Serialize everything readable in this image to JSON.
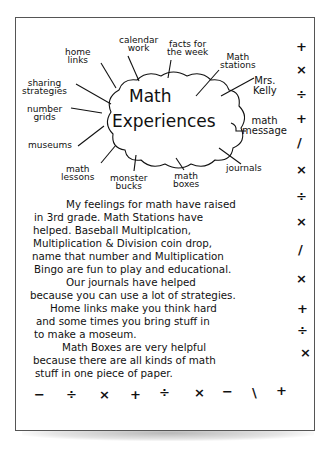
{
  "document": {
    "title_line1": "Math",
    "title_line2": "Experiences",
    "web_labels": [
      {
        "id": "home-links",
        "text": "home\nlinks",
        "line1": "home",
        "line2": "links"
      },
      {
        "id": "calendar-work",
        "line1": "calendar",
        "line2": "work"
      },
      {
        "id": "facts-for-the-week",
        "line1": "facts for",
        "line2": "the week"
      },
      {
        "id": "math-stations",
        "line1": "Math",
        "line2": "stations"
      },
      {
        "id": "mrs-kelly",
        "line1": "Mrs.",
        "line2": "Kelly"
      },
      {
        "id": "math-message",
        "line1": "math",
        "line2": "message"
      },
      {
        "id": "journals",
        "line1": "journals"
      },
      {
        "id": "math-boxes",
        "line1": "math",
        "line2": "boxes"
      },
      {
        "id": "monster-bucks",
        "line1": "monster",
        "line2": "bucks"
      },
      {
        "id": "math-lessons",
        "line1": "math",
        "line2": "lessons"
      },
      {
        "id": "museums",
        "line1": "museums"
      },
      {
        "id": "number-grids",
        "line1": "number",
        "line2": "grids"
      },
      {
        "id": "sharing-strategies",
        "line1": "sharing",
        "line2": "strategies"
      }
    ],
    "paragraph_lines": [
      "My feelings for math have raised",
      "in 3rd grade. Math Stations have",
      "helped. Baseball Multiplcation,",
      "Multiplication & Division coin drop,",
      "name that number and Multiplication",
      "Bingo are fun to play and educational.",
      "Our journals have helped",
      "because you can use a lot of strategies.",
      "Home links make you think hard",
      "and some times you bring stuff in",
      "to make a moseum.",
      "Math Boxes are very helpful",
      "because there are all kinds of math",
      "stuff in one piece of paper."
    ],
    "right_symbols": [
      "+",
      "×",
      "÷",
      "+",
      "/",
      "×",
      "÷",
      "×",
      "/",
      "×",
      "+",
      "÷",
      "×"
    ],
    "bottom_symbols": [
      "−",
      "÷",
      "×",
      "+",
      "÷",
      "×",
      "−",
      "\\",
      "+"
    ]
  }
}
